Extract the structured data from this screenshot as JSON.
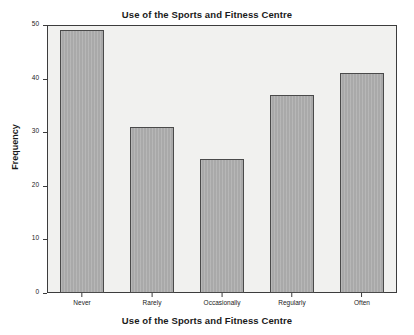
{
  "chart_data": {
    "type": "bar",
    "title": "Use of the Sports and Fitness Centre",
    "xlabel": "Use of the Sports and Fitness Centre",
    "ylabel": "Frequency",
    "categories": [
      "Never",
      "Rarely",
      "Occasionally",
      "Regularly",
      "Often"
    ],
    "values": [
      49,
      31,
      25,
      37,
      41
    ],
    "ylim": [
      0,
      50
    ],
    "yticks": [
      0,
      10,
      20,
      30,
      40,
      50
    ],
    "ytick_labels": [
      "0",
      "10",
      "20",
      "30",
      "40",
      "50"
    ],
    "grid": false,
    "legend": "none",
    "bar_color": "#a9a9a9",
    "bar_edge_color": "#4a4a4a",
    "plot_background": "#f1f1ef",
    "figure_background": "#ffffff",
    "axis_color": "#3c3c3c"
  }
}
